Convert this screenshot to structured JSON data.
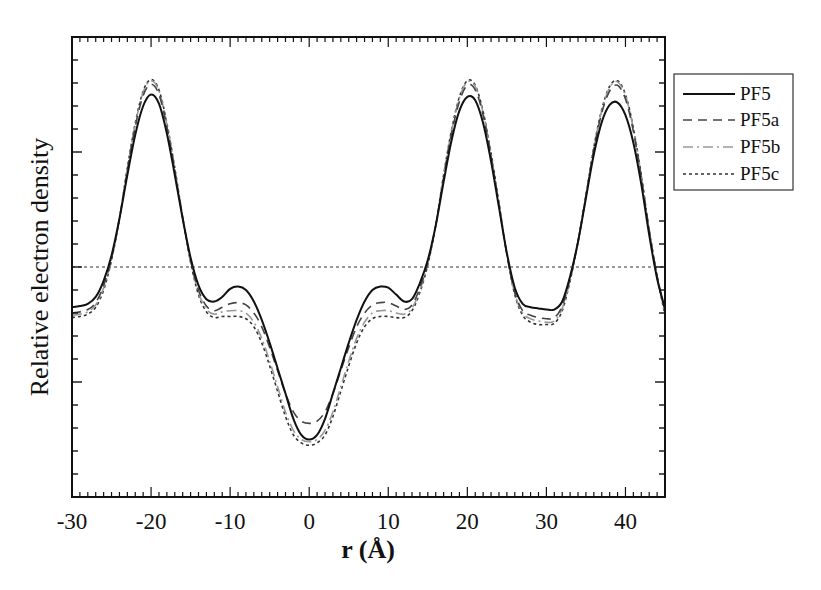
{
  "chart_data": {
    "type": "line",
    "title": "",
    "xlabel": "r (Å)",
    "ylabel": "Relative electron density",
    "xlim": [
      -30,
      45
    ],
    "ylim": [
      -2,
      2
    ],
    "x_ticks": [
      -30,
      -20,
      -10,
      0,
      10,
      20,
      30,
      40
    ],
    "x_tick_labels": [
      "-30",
      "-20",
      "-10",
      "0",
      "10",
      "20",
      "30",
      "40"
    ],
    "x_minor_step": 1,
    "y_major_ticks": [
      -1,
      0,
      1
    ],
    "y_minor_step": 0.2,
    "y_tick_labels_shown": false,
    "reference_line": {
      "y": 0,
      "style": "dotted"
    },
    "legend_position": "outside-right-top",
    "grid": false,
    "x": [
      -30,
      -29,
      -28,
      -27,
      -26,
      -25,
      -24,
      -23,
      -22,
      -21,
      -20,
      -19,
      -18,
      -17,
      -16,
      -15,
      -14,
      -13,
      -12,
      -11,
      -10,
      -9,
      -8,
      -7,
      -6,
      -5,
      -4,
      -3,
      -2,
      -1,
      0,
      1,
      2,
      3,
      4,
      5,
      6,
      7,
      8,
      9,
      10,
      11,
      12,
      13,
      14,
      15,
      16,
      17,
      18,
      19,
      20,
      21,
      22,
      23,
      24,
      25,
      26,
      27,
      28,
      29,
      30,
      31,
      32,
      33,
      34,
      35,
      36,
      37,
      38,
      39,
      40,
      41,
      42,
      43,
      44,
      45
    ],
    "series": [
      {
        "name": "PF5",
        "style": "solid",
        "color": "#111111",
        "width": 2.0,
        "values": [
          -0.35,
          -0.34,
          -0.32,
          -0.26,
          -0.12,
          0.1,
          0.42,
          0.8,
          1.15,
          1.4,
          1.5,
          1.42,
          1.16,
          0.8,
          0.42,
          0.08,
          -0.16,
          -0.28,
          -0.3,
          -0.26,
          -0.19,
          -0.17,
          -0.2,
          -0.3,
          -0.46,
          -0.66,
          -0.88,
          -1.1,
          -1.32,
          -1.46,
          -1.5,
          -1.46,
          -1.32,
          -1.1,
          -0.88,
          -0.66,
          -0.46,
          -0.3,
          -0.2,
          -0.17,
          -0.18,
          -0.24,
          -0.3,
          -0.28,
          -0.14,
          0.06,
          0.36,
          0.74,
          1.1,
          1.36,
          1.48,
          1.45,
          1.25,
          0.92,
          0.52,
          0.12,
          -0.18,
          -0.32,
          -0.35,
          -0.36,
          -0.37,
          -0.37,
          -0.3,
          -0.08,
          0.22,
          0.6,
          0.98,
          1.26,
          1.41,
          1.43,
          1.32,
          1.08,
          0.72,
          0.28,
          -0.1,
          -0.36
        ]
      },
      {
        "name": "PF5a",
        "style": "dashed",
        "color": "#444444",
        "width": 1.6,
        "values": [
          -0.4,
          -0.39,
          -0.37,
          -0.31,
          -0.16,
          0.08,
          0.42,
          0.84,
          1.22,
          1.49,
          1.59,
          1.5,
          1.22,
          0.84,
          0.43,
          0.06,
          -0.2,
          -0.34,
          -0.38,
          -0.35,
          -0.32,
          -0.31,
          -0.33,
          -0.4,
          -0.52,
          -0.7,
          -0.9,
          -1.1,
          -1.26,
          -1.34,
          -1.36,
          -1.34,
          -1.26,
          -1.1,
          -0.9,
          -0.7,
          -0.52,
          -0.4,
          -0.33,
          -0.31,
          -0.31,
          -0.34,
          -0.37,
          -0.33,
          -0.18,
          0.04,
          0.36,
          0.78,
          1.16,
          1.44,
          1.58,
          1.54,
          1.32,
          0.96,
          0.54,
          0.11,
          -0.22,
          -0.38,
          -0.42,
          -0.44,
          -0.45,
          -0.44,
          -0.34,
          -0.1,
          0.22,
          0.62,
          1.02,
          1.34,
          1.53,
          1.58,
          1.46,
          1.18,
          0.78,
          0.32,
          -0.08,
          -0.38
        ]
      },
      {
        "name": "PF5b",
        "style": "dashdot",
        "color": "#999999",
        "width": 1.6,
        "values": [
          -0.42,
          -0.41,
          -0.39,
          -0.33,
          -0.18,
          0.07,
          0.42,
          0.85,
          1.24,
          1.52,
          1.62,
          1.53,
          1.24,
          0.85,
          0.43,
          0.05,
          -0.22,
          -0.37,
          -0.41,
          -0.39,
          -0.38,
          -0.38,
          -0.4,
          -0.48,
          -0.62,
          -0.82,
          -1.04,
          -1.26,
          -1.42,
          -1.5,
          -1.52,
          -1.5,
          -1.42,
          -1.26,
          -1.04,
          -0.82,
          -0.62,
          -0.48,
          -0.4,
          -0.38,
          -0.38,
          -0.4,
          -0.41,
          -0.36,
          -0.2,
          0.03,
          0.36,
          0.79,
          1.18,
          1.47,
          1.61,
          1.57,
          1.34,
          0.98,
          0.55,
          0.11,
          -0.23,
          -0.4,
          -0.45,
          -0.47,
          -0.48,
          -0.47,
          -0.36,
          -0.11,
          0.22,
          0.62,
          1.03,
          1.36,
          1.56,
          1.61,
          1.49,
          1.2,
          0.79,
          0.32,
          -0.08,
          -0.4
        ]
      },
      {
        "name": "PF5c",
        "style": "dotted",
        "color": "#333333",
        "width": 1.6,
        "values": [
          -0.44,
          -0.43,
          -0.41,
          -0.35,
          -0.2,
          0.06,
          0.42,
          0.86,
          1.25,
          1.53,
          1.63,
          1.54,
          1.25,
          0.86,
          0.43,
          0.04,
          -0.24,
          -0.39,
          -0.44,
          -0.43,
          -0.43,
          -0.43,
          -0.45,
          -0.52,
          -0.66,
          -0.86,
          -1.08,
          -1.3,
          -1.46,
          -1.53,
          -1.55,
          -1.53,
          -1.46,
          -1.3,
          -1.08,
          -0.86,
          -0.66,
          -0.52,
          -0.45,
          -0.43,
          -0.43,
          -0.44,
          -0.44,
          -0.38,
          -0.22,
          0.02,
          0.36,
          0.8,
          1.19,
          1.48,
          1.62,
          1.58,
          1.35,
          0.99,
          0.56,
          0.11,
          -0.24,
          -0.42,
          -0.48,
          -0.5,
          -0.5,
          -0.49,
          -0.38,
          -0.12,
          0.22,
          0.62,
          1.04,
          1.37,
          1.57,
          1.62,
          1.5,
          1.21,
          0.8,
          0.32,
          -0.08,
          -0.42
        ]
      }
    ]
  },
  "legend": {
    "items": [
      {
        "label": "PF5",
        "style": "solid"
      },
      {
        "label": "PF5a",
        "style": "dashed"
      },
      {
        "label": "PF5b",
        "style": "dashdot"
      },
      {
        "label": "PF5c",
        "style": "dotted"
      }
    ]
  },
  "layout": {
    "plot": {
      "left": 72,
      "top": 37,
      "right": 665,
      "bottom": 497
    },
    "legend_box": {
      "left": 674,
      "top": 74,
      "right": 793,
      "bottom": 190
    }
  }
}
